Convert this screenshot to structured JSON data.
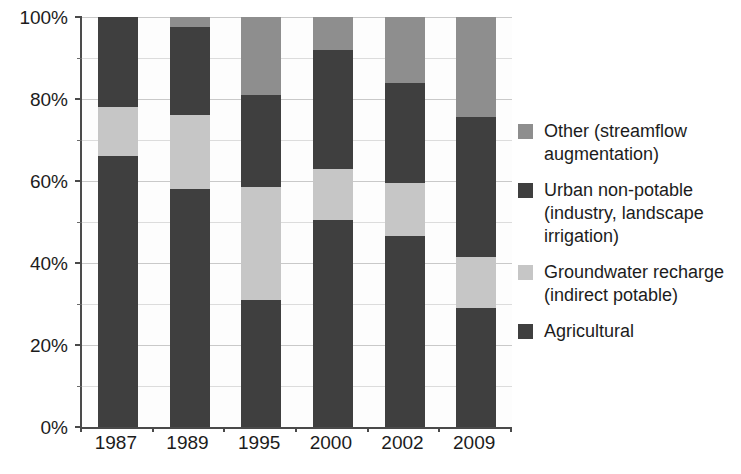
{
  "chart_data": {
    "type": "bar",
    "subtype": "stacked-bar-100-percent",
    "title": "",
    "xlabel": "",
    "ylabel": "",
    "ylim": [
      0,
      100
    ],
    "y_unit": "%",
    "grid": true,
    "legend_position": "right",
    "categories": [
      "1987",
      "1989",
      "1995",
      "2000",
      "2002",
      "2009"
    ],
    "y_ticks": [
      "0%",
      "20%",
      "40%",
      "60%",
      "80%",
      "100%"
    ],
    "y_tick_values": [
      0,
      20,
      40,
      60,
      80,
      100
    ],
    "y_minor_tick_values": [
      10,
      30,
      50,
      70,
      90
    ],
    "series": [
      {
        "name": "Agricultural",
        "color": "#3f3f3f",
        "values": [
          66.0,
          58.0,
          31.0,
          50.5,
          46.5,
          29.0
        ]
      },
      {
        "name": "Groundwater recharge (indirect potable)",
        "color": "#c6c6c6",
        "values": [
          12.0,
          18.0,
          27.5,
          12.5,
          13.0,
          12.5
        ]
      },
      {
        "name": "Urban non-potable (industry, landscape irrigation)",
        "color": "#3f3f3f",
        "values": [
          22.0,
          21.5,
          22.5,
          29.0,
          24.5,
          34.0
        ]
      },
      {
        "name": "Other (streamflow augmentation)",
        "color": "#8e8e8e",
        "values": [
          0.0,
          2.5,
          19.0,
          8.0,
          16.0,
          24.5
        ]
      }
    ],
    "cumulative_boundaries": {
      "1987": [
        0,
        66.0,
        78.0,
        100.0,
        100.0
      ],
      "1989": [
        0,
        58.0,
        76.0,
        97.5,
        100.0
      ],
      "1995": [
        0,
        31.0,
        58.5,
        81.0,
        100.0
      ],
      "2000": [
        0,
        50.5,
        63.0,
        92.0,
        100.0
      ],
      "2002": [
        0,
        46.5,
        59.5,
        84.0,
        100.0
      ],
      "2009": [
        0,
        29.0,
        41.5,
        75.5,
        100.0
      ]
    }
  },
  "legend": {
    "items": [
      {
        "label": "Other (streamflow\naugmentation)",
        "color": "#8e8e8e",
        "series_key": "other"
      },
      {
        "label": "Urban non-potable\n(industry, landscape\nirrigation)",
        "color": "#3f3f3f",
        "series_key": "urban-non-potable"
      },
      {
        "label": "Groundwater recharge\n(indirect potable)",
        "color": "#c6c6c6",
        "series_key": "groundwater-recharge"
      },
      {
        "label": "Agricultural",
        "color": "#3f3f3f",
        "series_key": "agricultural"
      }
    ]
  },
  "colors": {
    "agricultural": "#3f3f3f",
    "groundwater_recharge": "#c6c6c6",
    "urban_non_potable": "#3f3f3f",
    "other": "#8e8e8e",
    "axis": "#4a4a4a",
    "gridline": "#c9c9c9",
    "text": "#1c1c1c",
    "plot_background": "#fdfdfd"
  }
}
